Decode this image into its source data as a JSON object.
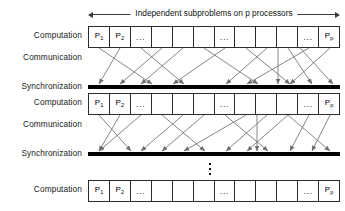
{
  "diagram": {
    "title_span": "Independent subproblems on p processors",
    "span_arrow": {
      "left_cap": "left-arrowhead",
      "right_cap": "right-arrowhead"
    },
    "labels": {
      "computation": "Computation",
      "communication": "Communication",
      "synchronization": "Synchronization"
    },
    "rows": [
      {
        "name": "computation-row-1",
        "label": "Computation",
        "type": "processor-boxes",
        "top": 26
      },
      {
        "name": "communication-row-1",
        "label": "Communication",
        "type": "arrow-fan",
        "top": 48
      },
      {
        "name": "synchronization-row-1",
        "label": "Synchronization",
        "type": "sync-bar",
        "top": 85
      },
      {
        "name": "computation-row-2",
        "label": "Computation",
        "type": "processor-boxes",
        "top": 93
      },
      {
        "name": "communication-row-2",
        "label": "Communication",
        "type": "arrow-fan",
        "top": 115
      },
      {
        "name": "synchronization-row-2",
        "label": "Synchronization",
        "type": "sync-bar",
        "top": 152
      },
      {
        "name": "vertical-ellipsis",
        "label": "",
        "type": "ellipsis",
        "top": 160
      },
      {
        "name": "computation-row-3",
        "label": "Computation",
        "type": "processor-boxes",
        "top": 180
      }
    ],
    "processor_cells": [
      {
        "label": "P",
        "sub": "1",
        "kind": "processor"
      },
      {
        "label": "P",
        "sub": "2",
        "kind": "processor"
      },
      {
        "label": "...",
        "sub": "",
        "kind": "ellipsis"
      },
      {
        "label": "",
        "sub": "",
        "kind": "blank"
      },
      {
        "label": "",
        "sub": "",
        "kind": "blank"
      },
      {
        "label": "",
        "sub": "",
        "kind": "blank"
      },
      {
        "label": "...",
        "sub": "",
        "kind": "ellipsis"
      },
      {
        "label": "",
        "sub": "",
        "kind": "blank"
      },
      {
        "label": "",
        "sub": "",
        "kind": "blank"
      },
      {
        "label": "",
        "sub": "",
        "kind": "blank"
      },
      {
        "label": "...",
        "sub": "",
        "kind": "ellipsis"
      },
      {
        "label": "P",
        "sub": "p",
        "kind": "processor"
      }
    ],
    "colors": {
      "box_stroke": "#2b2b2b",
      "bar_fill": "#000000",
      "arrow_stroke": "#6f6f6f",
      "text": "#111111",
      "background": "#ffffff"
    },
    "ellipsis_dot_count": 3,
    "message_arrows_note": "crossing point-to-point message arrows from processor boxes down to the synchronization barrier"
  }
}
